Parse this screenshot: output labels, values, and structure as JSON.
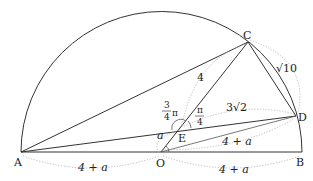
{
  "diagram": {
    "type": "geometry",
    "points": {
      "A": {
        "label": "A",
        "x": 21,
        "y": 152
      },
      "O": {
        "label": "O",
        "x": 161,
        "y": 152
      },
      "B": {
        "label": "B",
        "x": 302,
        "y": 152
      },
      "C": {
        "label": "C",
        "x": 248,
        "y": 42
      },
      "D": {
        "label": "D",
        "x": 296,
        "y": 116
      },
      "E": {
        "label": "E",
        "x": 180,
        "y": 129
      }
    },
    "segment_labels": {
      "OC_part": "4",
      "CD": "√10",
      "ED": "3√2",
      "OD": "4 + a",
      "AO": "4 + a",
      "OB": "4 + a",
      "AE_side": "a"
    },
    "angle_labels": {
      "angle_AEC": {
        "num": "3",
        "den": "4",
        "suffix": "π"
      },
      "angle_CED": {
        "num": "π",
        "den": "4"
      }
    }
  }
}
